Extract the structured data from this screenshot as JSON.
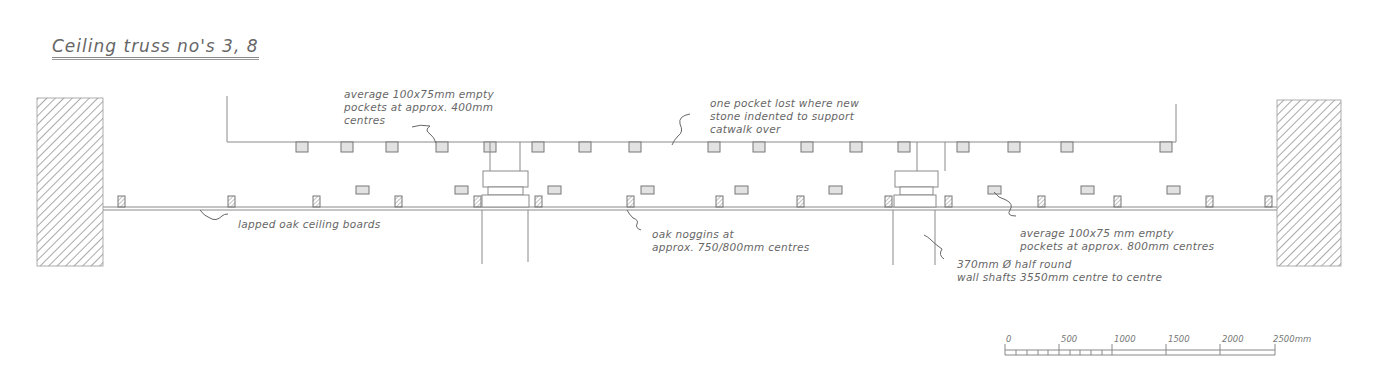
{
  "title": "Ceiling truss no's 3, 8",
  "annotations": {
    "pockets_top": "average 100x75mm empty\npockets at approx. 400mm\ncentres",
    "pocket_lost": "one pocket lost where new\nstone indented to support\ncatwalk over",
    "ceiling_boards": "lapped oak ceiling boards",
    "noggins": "oak noggins at\napprox. 750/800mm centres",
    "pockets_lower": "average 100x75 mm empty\npockets at approx. 800mm centres",
    "wall_shafts": "370mm Ø half round\nwall shafts 3550mm centre to centre"
  },
  "scale_bar": {
    "labels": [
      "0",
      "500",
      "1000",
      "1500",
      "2000",
      "2500mm"
    ],
    "unit": "mm"
  },
  "colors": {
    "line": "#8a8a8a",
    "pocket_fill": "#e2e2e2",
    "noggin_fill": "#bdbdbd",
    "wall_hatch": "#7a7a7a"
  },
  "geometry": {
    "top_pockets_x": [
      296,
      341,
      386,
      436,
      484,
      532,
      579,
      629,
      708,
      753,
      801,
      850,
      898,
      957,
      1008,
      1061,
      1160
    ],
    "lower_pockets_x": [
      356,
      455,
      548,
      641,
      735,
      829,
      988,
      1081,
      1167
    ],
    "noggins_x": [
      118,
      228,
      313,
      395,
      474,
      535,
      627,
      716,
      797,
      885,
      945,
      1038,
      1114,
      1206,
      1265
    ],
    "shaft_centres_x": [
      510,
      914
    ]
  }
}
